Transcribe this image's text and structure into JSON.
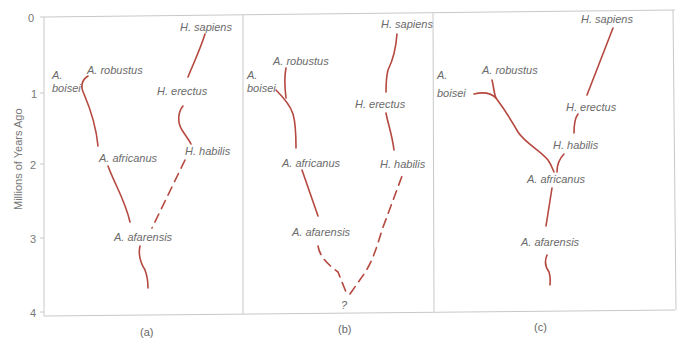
{
  "figure": {
    "axis": {
      "title": "Millions of  Years Ago",
      "ticks": [
        "0",
        "1",
        "2",
        "3",
        "4"
      ]
    },
    "line_color": "#b5483f",
    "panels": [
      {
        "caption": "(a)",
        "labels": {
          "a_boisei_1": "A.",
          "a_boisei_2": "boisei",
          "a_robustus": "A. robustus",
          "a_africanus": "A. africanus",
          "a_afarensis": "A. afarensis",
          "h_sapiens": "H. sapiens",
          "h_erectus": "H. erectus",
          "h_habilis": "H. habilis"
        }
      },
      {
        "caption": "(b)",
        "labels": {
          "a_boisei_1": "A.",
          "a_boisei_2": "boisei",
          "a_robustus": "A. robustus",
          "a_africanus": "A. africanus",
          "a_afarensis": "A. afarensis",
          "h_sapiens": "H. sapiens",
          "h_erectus": "H. erectus",
          "h_habilis": "H. habilis",
          "unknown": "?"
        }
      },
      {
        "caption": "(c)",
        "labels": {
          "a_boisei_1": "A.",
          "a_boisei_2": "boisei",
          "a_robustus": "A. robustus",
          "a_africanus": "A. africanus",
          "a_afarensis": "A. afarensis",
          "h_sapiens": "H. sapiens",
          "h_erectus": "H. erectus",
          "h_habilis": "H. habilis"
        }
      }
    ]
  }
}
